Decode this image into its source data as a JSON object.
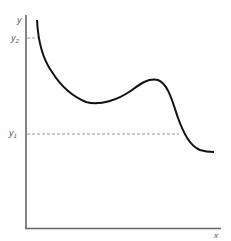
{
  "diagram": {
    "axes": {
      "y_label": "y",
      "x_label": "x"
    },
    "levels": [
      {
        "name": "y2",
        "label": "y",
        "subscript": "2"
      },
      {
        "name": "y1",
        "label": "y",
        "subscript": "1"
      }
    ],
    "colors": {
      "axis": "#555555",
      "curve": "#111111",
      "dashed": "#999999",
      "text": "#555555"
    }
  }
}
